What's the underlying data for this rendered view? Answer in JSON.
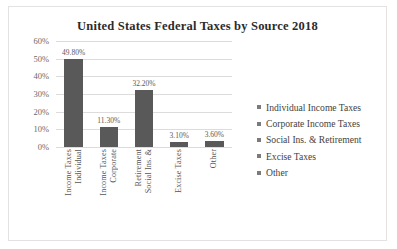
{
  "chart_data": {
    "type": "bar",
    "title": "United States Federal Taxes by Source 2018",
    "xlabel": "",
    "ylabel": "",
    "ylim": [
      0,
      60
    ],
    "grid": true,
    "legend_position": "right",
    "categories": [
      "Individual Income Taxes",
      "Corporate Income Taxes",
      "Social Ins. & Retirement",
      "Excise Taxes",
      "Other"
    ],
    "category_lines": [
      [
        "Individual",
        "Income Taxes"
      ],
      [
        "Corporate",
        "Income Taxes"
      ],
      [
        "Social Ins. &",
        "Retirement"
      ],
      [
        "Excise Taxes"
      ],
      [
        "Other"
      ]
    ],
    "values": [
      49.8,
      11.3,
      32.2,
      3.1,
      3.6
    ],
    "data_labels": [
      "49.80%",
      "11.30%",
      "32.20%",
      "3.10%",
      "3.60%"
    ],
    "y_ticks": [
      60,
      50,
      40,
      30,
      20,
      10,
      0
    ],
    "y_tick_labels": [
      "60%",
      "50%",
      "40%",
      "30%",
      "20%",
      "10%",
      "0%"
    ],
    "legend": [
      "Individual Income Taxes",
      "Corporate Income Taxes",
      "Social Ins. & Retirement",
      "Excise Taxes",
      "Other"
    ],
    "colors": {
      "bar": "#595959",
      "gridline": "#dcdcdc",
      "title_text": "#2b2b2b",
      "tick_text": "#6a6a6a",
      "legend_text": "#3f3f3f",
      "legend_marker": "#7b7b7b",
      "frame_border": "#e2e2e2",
      "background": "#ffffff"
    }
  }
}
